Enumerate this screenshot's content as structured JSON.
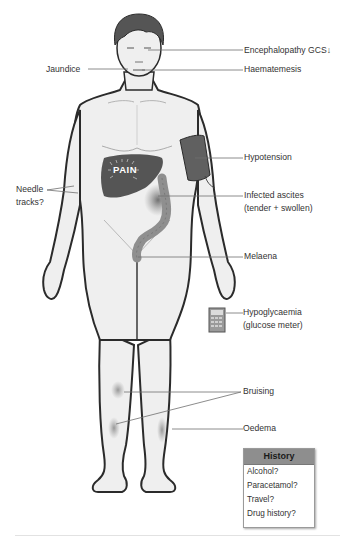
{
  "diagram": {
    "pain_label": "PAIN",
    "labels": {
      "encephalopathy": "Encephalopathy  GCS",
      "gcs_arrow": "↓",
      "jaundice": "Jaundice",
      "haematemesis": "Haematemesis",
      "hypotension": "Hypotension",
      "needle_tracks_line1": "Needle",
      "needle_tracks_line2": "tracks?",
      "infected_ascites_line1": "Infected ascites",
      "infected_ascites_line2": "(tender + swollen)",
      "melaena": "Melaena",
      "hypoglycaemia_line1": "Hypoglycaemia",
      "hypoglycaemia_line2": "(glucose meter)",
      "bruising": "Bruising",
      "oedema": "Oedema"
    },
    "history": {
      "title": "History",
      "items": [
        "Alcohol?",
        "Paracetamol?",
        "Travel?",
        "Drug history?"
      ]
    },
    "colors": {
      "skin": "#f0f0f0",
      "outline": "#2b2b2b",
      "hair": "#555555",
      "liver": "#555555",
      "bp_cuff": "#606060",
      "colon": "#8f8f8f",
      "leader_line": "#6e6e6e",
      "history_header": "#8e8e8e"
    }
  }
}
